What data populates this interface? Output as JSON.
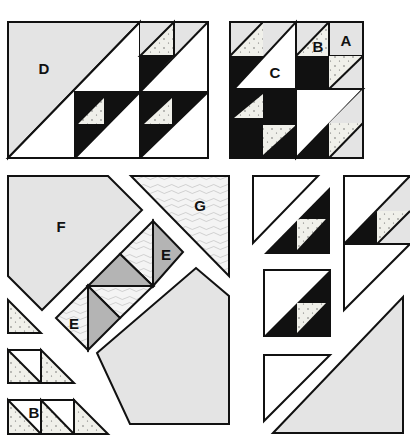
{
  "colors": {
    "light_gray": "#e4e4e4",
    "black": "#111111",
    "white": "#ffffff",
    "speckled": "#f0f0ea",
    "medium_gray": "#b4b4b4",
    "textured": "#f2f2f2",
    "outline": "#111111"
  },
  "labels": {
    "D": "D",
    "C": "C",
    "B_top": "B",
    "A": "A",
    "F": "F",
    "G": "G",
    "E_upper": "E",
    "E_lower": "E",
    "B_bottom": "B"
  },
  "pieces": [
    {
      "id": "block-left",
      "description": "Completed left block with large half-square triangle D and two Birds units"
    },
    {
      "id": "block-right",
      "description": "Completed right square block with pieces A, B, C"
    },
    {
      "id": "piece-F",
      "description": "Large light-gray clipped corner pentagon F"
    },
    {
      "id": "piece-G",
      "description": "Textured triangle G"
    },
    {
      "id": "strip-E",
      "description": "Diagonal strip with medium-gray and textured triangles E"
    },
    {
      "id": "piece-lower-pentagon",
      "description": "Large light-gray clipped pentagon"
    },
    {
      "id": "small-triangles",
      "description": "Speckled small half-square triangles and units B"
    },
    {
      "id": "right-column-units",
      "description": "Black/white/speckled triangle units and large light-gray triangle"
    }
  ]
}
